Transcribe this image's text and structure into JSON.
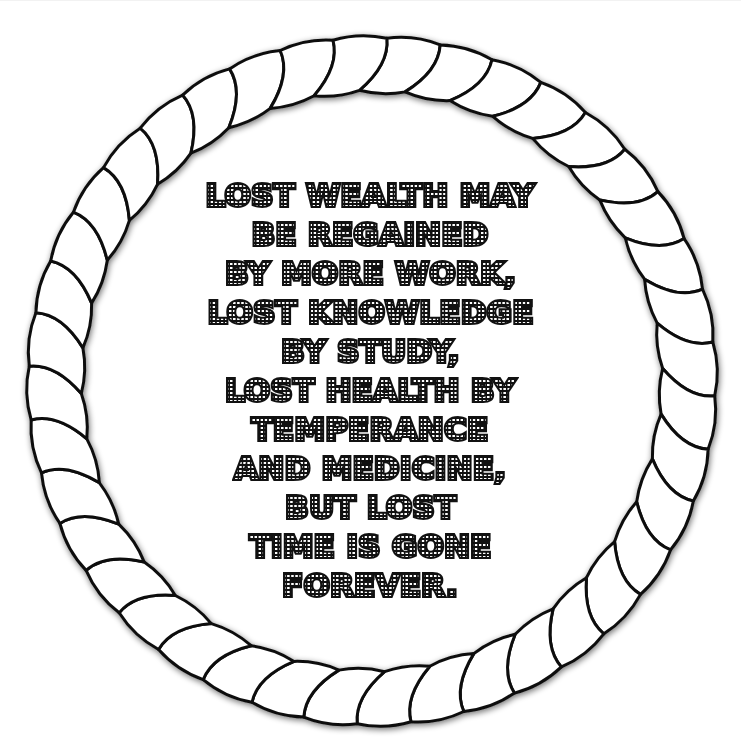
{
  "artwork": {
    "type": "quote-coloring-page",
    "border": {
      "style": "twisted-rope-ring",
      "segment_count": 40,
      "stroke_color": "#111111",
      "fill_color": "#ffffff",
      "shadow_color": "#9a9a9a"
    },
    "quote": {
      "lettering_style": "marquee-dotted-outline",
      "text_color": "#111111",
      "lines": [
        "LOST WEALTH MAY",
        "BE REGAINED",
        "BY MORE WORK,",
        "LOST KNOWLEDGE",
        "BY STUDY,",
        "LOST HEALTH BY",
        "TEMPERANCE",
        "AND MEDICINE,",
        "BUT LOST",
        "TIME IS GONE",
        "FOREVER."
      ]
    }
  }
}
